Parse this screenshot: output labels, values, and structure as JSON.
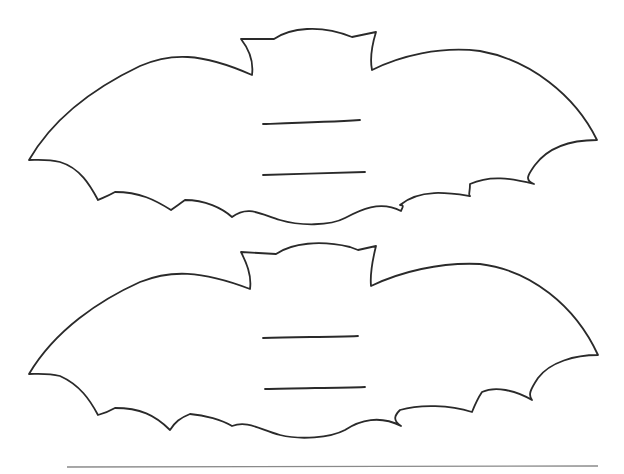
{
  "page": {
    "title": "",
    "background": "#ffffff",
    "stroke_color": "#2a2a2a",
    "base_line_color": "#8a8a8a"
  },
  "bats": [
    {
      "name": "bat-top",
      "lines": 2
    },
    {
      "name": "bat-bottom",
      "lines": 2
    }
  ],
  "base_line": {
    "x1": 67,
    "x2": 598,
    "y": 467
  }
}
